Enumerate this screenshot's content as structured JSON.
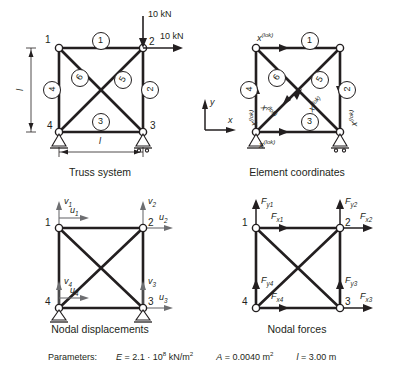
{
  "figures": [
    {
      "id": "truss-system",
      "caption": "Truss system",
      "nodes": [
        {
          "id": "1",
          "label": "1",
          "x": 0,
          "y": 0
        },
        {
          "id": "2",
          "label": "2",
          "x": 1,
          "y": 0
        },
        {
          "id": "3",
          "label": "3",
          "x": 1,
          "y": 1
        },
        {
          "id": "4",
          "label": "4",
          "x": 0,
          "y": 1
        }
      ],
      "elements": [
        {
          "label": "1",
          "from": "1",
          "to": "2",
          "rotation": 0
        },
        {
          "label": "2",
          "from": "2",
          "to": "3",
          "rotation": -90
        },
        {
          "label": "3",
          "from": "4",
          "to": "3",
          "rotation": 0
        },
        {
          "label": "4",
          "from": "1",
          "to": "4",
          "rotation": -90
        },
        {
          "label": "5",
          "from": "1",
          "to": "3",
          "rotation": -50
        },
        {
          "label": "6",
          "from": "4",
          "to": "2",
          "rotation": -50
        }
      ],
      "loads": [
        {
          "label": "10 kN",
          "direction": "down",
          "at": "2"
        },
        {
          "label": "10 kN",
          "direction": "right",
          "at": "2"
        }
      ],
      "dimensions": [
        {
          "label": "l",
          "orientation": "vertical"
        },
        {
          "label": "l",
          "orientation": "horizontal"
        }
      ],
      "supports": [
        "3",
        "4"
      ]
    },
    {
      "id": "element-coordinates",
      "caption": "Element coordinates",
      "elements": [
        {
          "label": "1",
          "rotation": 0
        },
        {
          "label": "2",
          "rotation": -90
        },
        {
          "label": "3",
          "rotation": 0
        },
        {
          "label": "4",
          "rotation": -90
        },
        {
          "label": "5",
          "rotation": -50
        },
        {
          "label": "6",
          "rotation": -50
        }
      ],
      "local_axis_label": "x",
      "local_axis_sup": "(lok)",
      "local_axis_count": 6,
      "global_axes": {
        "x": "x",
        "y": "y"
      }
    },
    {
      "id": "nodal-displacements",
      "caption": "Nodal displacements",
      "nodes": [
        {
          "id": "1",
          "label": "1"
        },
        {
          "id": "2",
          "label": "2"
        },
        {
          "id": "3",
          "label": "3"
        },
        {
          "id": "4",
          "label": "4"
        }
      ],
      "dof": [
        {
          "sym": "v",
          "sub": "1",
          "at": "1",
          "direction": "up"
        },
        {
          "sym": "u",
          "sub": "1",
          "at": "1",
          "direction": "right"
        },
        {
          "sym": "v",
          "sub": "2",
          "at": "2",
          "direction": "up"
        },
        {
          "sym": "u",
          "sub": "2",
          "at": "2",
          "direction": "right"
        },
        {
          "sym": "v",
          "sub": "3",
          "at": "3",
          "direction": "up"
        },
        {
          "sym": "u",
          "sub": "3",
          "at": "3",
          "direction": "right"
        },
        {
          "sym": "v",
          "sub": "4",
          "at": "4",
          "direction": "up"
        },
        {
          "sym": "u",
          "sub": "4",
          "at": "4",
          "direction": "right"
        }
      ],
      "supports": [
        "3",
        "4"
      ]
    },
    {
      "id": "nodal-forces",
      "caption": "Nodal forces",
      "nodes": [
        {
          "id": "1",
          "label": "1"
        },
        {
          "id": "2",
          "label": "2"
        },
        {
          "id": "3",
          "label": "3"
        },
        {
          "id": "4",
          "label": "4"
        }
      ],
      "dof": [
        {
          "sym": "F",
          "sub": "y1",
          "at": "1",
          "direction": "up"
        },
        {
          "sym": "F",
          "sub": "x1",
          "at": "1",
          "direction": "right"
        },
        {
          "sym": "F",
          "sub": "y2",
          "at": "2",
          "direction": "up"
        },
        {
          "sym": "F",
          "sub": "x2",
          "at": "2",
          "direction": "right"
        },
        {
          "sym": "F",
          "sub": "y3",
          "at": "3",
          "direction": "up"
        },
        {
          "sym": "F",
          "sub": "x3",
          "at": "3",
          "direction": "right"
        },
        {
          "sym": "F",
          "sub": "y4",
          "at": "4",
          "direction": "up"
        },
        {
          "sym": "F",
          "sub": "x4",
          "at": "4",
          "direction": "right"
        }
      ]
    }
  ],
  "parameters": {
    "title": "Parameters:",
    "E_sym": "E",
    "E_value": " = 2.1 · 10",
    "E_exp": "8",
    "E_unit": " kN/m",
    "E_unit_exp": "2",
    "A_sym": "A",
    "A_value": " = 0.0040 m",
    "A_exp": "2",
    "l_sym": "l",
    "l_value": " = 3.00 m"
  },
  "colors": {
    "line": "#231f20",
    "text": "#231f20",
    "background": "#ffffff"
  }
}
